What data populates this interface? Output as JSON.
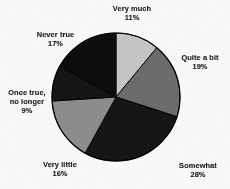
{
  "chart_data": {
    "type": "pie",
    "title": "",
    "subtitle": "",
    "xlabel": "",
    "ylabel": "",
    "legend_position": "none",
    "grid": false,
    "labels_show_percent": true,
    "total_percent": 100,
    "start_angle_deg": 0,
    "direction": "clockwise",
    "categories": [
      "Very much",
      "Quite a bit",
      "Somewhat",
      "Very little",
      "Once true, no longer",
      "Never true"
    ],
    "values": [
      11,
      19,
      28,
      16,
      9,
      17
    ],
    "slices": [
      {
        "label": "Very much",
        "label_line1": "Very much",
        "value": 11,
        "percent_text": "11%",
        "color": "#c9c9c9"
      },
      {
        "label": "Quite a bit",
        "label_line1": "Quite a bit",
        "value": 19,
        "percent_text": "19%",
        "color": "#6e6e6e"
      },
      {
        "label": "Somewhat",
        "label_line1": "Somewhat",
        "value": 28,
        "percent_text": "28%",
        "color": "#141414"
      },
      {
        "label": "Very little",
        "label_line1": "Very little",
        "value": 16,
        "percent_text": "16%",
        "color": "#8f8f8f"
      },
      {
        "label": "Once true, no longer",
        "label_line1": "Once true,",
        "label_line2": "no longer",
        "value": 9,
        "percent_text": "9%",
        "color": "#121212"
      },
      {
        "label": "Never true",
        "label_line1": "Never true",
        "value": 17,
        "percent_text": "17%",
        "color": "#101010"
      }
    ]
  },
  "figure": {
    "background_color": "#fdfdfd",
    "outline_color": "#000000",
    "center_x": 116,
    "center_y": 97,
    "radius": 64
  }
}
